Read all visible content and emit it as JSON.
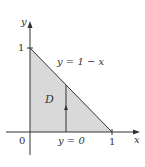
{
  "diagram": {
    "title": "",
    "region_label": "D",
    "curve_label": "y = 1 − x",
    "bottom_label": "y = 0",
    "axis_x_label": "x",
    "axis_y_label": "y",
    "origin_label": "0",
    "x_tick_label": "1",
    "y_tick_label": "1",
    "colors": {
      "region_fill": "#d9d9d9",
      "line": "#333333",
      "background": "#ffffff"
    }
  }
}
